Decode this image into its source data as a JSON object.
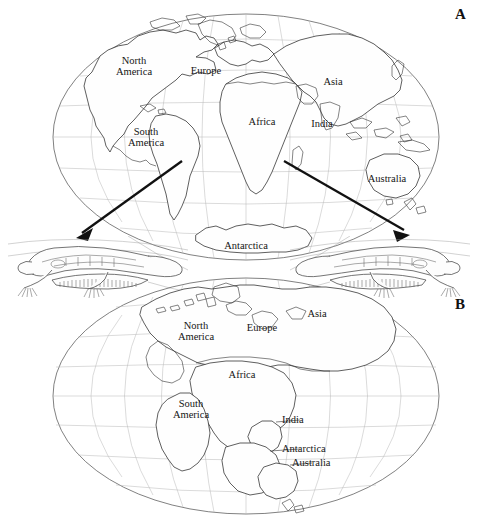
{
  "figure": {
    "type": "two-panel world map diagram",
    "background_color": "#ffffff",
    "line_color": "#2a2a2a",
    "graticule_color": "#b6b6b6",
    "spine_caption": "Continental Drift  ·  Mesosaurus"
  },
  "panels": [
    {
      "letter": "A",
      "name": "present-day-continents-map",
      "projection": "oval (Mollweide-like) world projection",
      "labels": [
        {
          "text": "North\nAmerica",
          "x": 128,
          "y": 60
        },
        {
          "text": "Europe",
          "x": 205,
          "y": 68
        },
        {
          "text": "Asia",
          "x": 333,
          "y": 79
        },
        {
          "text": "Africa",
          "x": 262,
          "y": 119
        },
        {
          "text": "India",
          "x": 322,
          "y": 121
        },
        {
          "text": "South\nAmerica",
          "x": 143,
          "y": 131
        },
        {
          "text": "Australia",
          "x": 385,
          "y": 176
        },
        {
          "text": "Antarctica",
          "x": 245,
          "y": 243
        }
      ]
    },
    {
      "letter": "B",
      "name": "pangaea-reconstruction-map",
      "projection": "oval (Mollweide-like) world projection",
      "labels": [
        {
          "text": "North\nAmerica",
          "x": 190,
          "y": 325
        },
        {
          "text": "Europe",
          "x": 261,
          "y": 326
        },
        {
          "text": "Asia",
          "x": 316,
          "y": 312
        },
        {
          "text": "Africa",
          "x": 241,
          "y": 373
        },
        {
          "text": "South\nAmerica",
          "x": 190,
          "y": 403
        },
        {
          "text": "India",
          "x": 297,
          "y": 420
        },
        {
          "text": "Antarctica",
          "x": 308,
          "y": 449
        },
        {
          "text": "Australia",
          "x": 311,
          "y": 463
        }
      ]
    }
  ],
  "fossils": [
    {
      "name": "mesosaurus-fossil-left",
      "orientation": "facing-left",
      "x": 14,
      "y": 238,
      "width": 170,
      "height": 58
    },
    {
      "name": "mesosaurus-fossil-right",
      "orientation": "facing-right",
      "x": 296,
      "y": 238,
      "width": 170,
      "height": 58
    }
  ],
  "arrows": [
    {
      "name": "arrow-south-america-to-fossil",
      "from": {
        "x": 182,
        "y": 161
      },
      "to": {
        "x": 76,
        "y": 238
      }
    },
    {
      "name": "arrow-africa-to-fossil",
      "from": {
        "x": 284,
        "y": 161
      },
      "to": {
        "x": 410,
        "y": 235
      }
    }
  ]
}
